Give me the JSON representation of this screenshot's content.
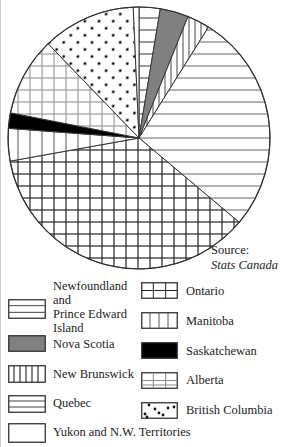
{
  "chart_data": {
    "type": "pie",
    "title": "",
    "start_angle_deg": 0,
    "direction": "clockwise",
    "units": "percent (estimated from slice angles)",
    "slices": [
      {
        "label": "Newfoundland and Prince Edward Island",
        "value": 2.6,
        "pattern": "hlines-boxed"
      },
      {
        "label": "Nova Scotia",
        "value": 3.5,
        "pattern": "grey"
      },
      {
        "label": "New Brunswick",
        "value": 2.8,
        "pattern": "vlines-dense"
      },
      {
        "label": "Quebec",
        "value": 27.2,
        "pattern": "hlines"
      },
      {
        "label": "Ontario",
        "value": 36.0,
        "pattern": "grid-dark"
      },
      {
        "label": "Manitoba",
        "value": 4.0,
        "pattern": "vlines"
      },
      {
        "label": "Saskatchewan",
        "value": 1.9,
        "pattern": "black"
      },
      {
        "label": "Alberta",
        "value": 9.7,
        "pattern": "grid-light"
      },
      {
        "label": "British Columbia",
        "value": 11.5,
        "pattern": "dots"
      },
      {
        "label": "Yukon and N.W. Territories",
        "value": 0.7,
        "pattern": "blank"
      }
    ],
    "legend_position": "bottom",
    "annotation": "Source: Stats Canada"
  },
  "source": {
    "label": "Source:",
    "org": "Stats Canada"
  },
  "legend": {
    "left": [
      {
        "lines": [
          "Newfoundland",
          "and",
          "Prince Edward",
          "Island"
        ],
        "pattern": "hlines-boxed"
      },
      {
        "lines": [
          "Nova Scotia"
        ],
        "pattern": "grey"
      },
      {
        "lines": [
          "New Brunswick"
        ],
        "pattern": "vlines-dense"
      },
      {
        "lines": [
          "Quebec"
        ],
        "pattern": "hlines"
      },
      {
        "lines": [
          "Yukon and N.W. Territories"
        ],
        "pattern": "blank"
      }
    ],
    "right": [
      {
        "lines": [
          "Ontario"
        ],
        "pattern": "grid-dark"
      },
      {
        "lines": [
          "Manitoba"
        ],
        "pattern": "vlines"
      },
      {
        "lines": [
          "Saskatchewan"
        ],
        "pattern": "black"
      },
      {
        "lines": [
          "Alberta"
        ],
        "pattern": "grid-light"
      },
      {
        "lines": [
          "British Columbia"
        ],
        "pattern": "dots"
      }
    ]
  },
  "colors": {
    "outline": "#333333",
    "grey_fill": "#808080",
    "black_fill": "#000000",
    "pattern_line": "#555555",
    "light_line": "#9a9a9a"
  }
}
